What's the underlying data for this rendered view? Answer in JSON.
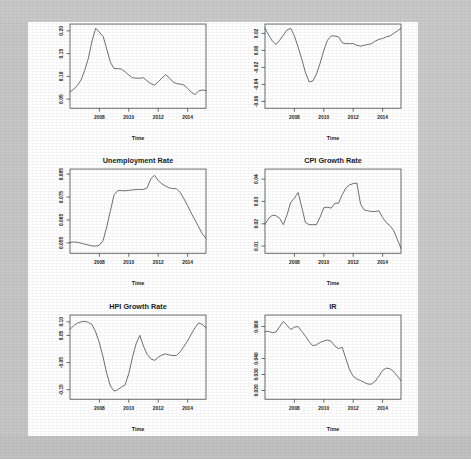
{
  "page": {
    "background_color": "#ffffff",
    "scan_border_color": "#c9c9c9",
    "line_color": "#55575a",
    "axis_color": "#4a4a4a",
    "text_color": "#1c1c1c"
  },
  "figure": {
    "layout": "2 columns x 3 rows",
    "panel_count": 6
  },
  "chart_data": [
    {
      "type": "line",
      "title": "LGD Rate",
      "xlabel": "Time",
      "ylabel": "",
      "xlim": [
        2006.0,
        2015.25
      ],
      "ylim": [
        0.03,
        0.215
      ],
      "xticks": [
        "2008",
        "2010",
        "2012",
        "2014"
      ],
      "xtickvals": [
        2008,
        2010,
        2012,
        2014
      ],
      "yticks": [
        "0.05",
        "0.10",
        "0.15",
        "0.20"
      ],
      "ytickvals": [
        0.05,
        0.1,
        0.15,
        0.2
      ],
      "grid": false,
      "legend": "none",
      "x": [
        2006.0,
        2006.25,
        2006.5,
        2006.75,
        2007.0,
        2007.25,
        2007.5,
        2007.75,
        2008.0,
        2008.25,
        2008.5,
        2008.75,
        2009.0,
        2009.25,
        2009.5,
        2009.75,
        2010.0,
        2010.25,
        2010.5,
        2010.75,
        2011.0,
        2011.25,
        2011.5,
        2011.75,
        2012.0,
        2012.25,
        2012.5,
        2012.75,
        2013.0,
        2013.25,
        2013.5,
        2013.75,
        2014.0,
        2014.25,
        2014.5,
        2014.75,
        2015.0,
        2015.25
      ],
      "values": [
        0.066,
        0.072,
        0.08,
        0.092,
        0.113,
        0.14,
        0.178,
        0.206,
        0.197,
        0.188,
        0.16,
        0.131,
        0.117,
        0.117,
        0.116,
        0.11,
        0.103,
        0.097,
        0.096,
        0.096,
        0.097,
        0.09,
        0.084,
        0.081,
        0.088,
        0.096,
        0.104,
        0.097,
        0.088,
        0.084,
        0.083,
        0.081,
        0.074,
        0.065,
        0.06,
        0.068,
        0.07,
        0.069
      ]
    },
    {
      "type": "line",
      "title": "GDP Growth Rate",
      "xlabel": "Time",
      "ylabel": "",
      "xlim": [
        2006.0,
        2015.25
      ],
      "ylim": [
        -0.068,
        0.031
      ],
      "xticks": [
        "2008",
        "2010",
        "2012",
        "2014"
      ],
      "xtickvals": [
        2008,
        2010,
        2012,
        2014
      ],
      "yticks": [
        "0.02",
        "0.00",
        "-0.02",
        "-0.04",
        "-0.06"
      ],
      "ytickvals": [
        0.02,
        0.0,
        -0.02,
        -0.04,
        -0.06
      ],
      "grid": false,
      "legend": "none",
      "x": [
        2006.0,
        2006.25,
        2006.5,
        2006.75,
        2007.0,
        2007.25,
        2007.5,
        2007.75,
        2008.0,
        2008.25,
        2008.5,
        2008.75,
        2009.0,
        2009.25,
        2009.5,
        2009.75,
        2010.0,
        2010.25,
        2010.5,
        2010.75,
        2011.0,
        2011.25,
        2011.5,
        2011.75,
        2012.0,
        2012.25,
        2012.5,
        2012.75,
        2013.0,
        2013.25,
        2013.5,
        2013.75,
        2014.0,
        2014.25,
        2014.5,
        2014.75,
        2015.0,
        2015.25
      ],
      "values": [
        0.026,
        0.018,
        0.011,
        0.007,
        0.012,
        0.018,
        0.024,
        0.026,
        0.017,
        0.004,
        -0.01,
        -0.026,
        -0.037,
        -0.036,
        -0.028,
        -0.015,
        0.0,
        0.012,
        0.017,
        0.017,
        0.016,
        0.009,
        0.008,
        0.008,
        0.008,
        0.006,
        0.005,
        0.006,
        0.007,
        0.008,
        0.011,
        0.013,
        0.014,
        0.016,
        0.017,
        0.02,
        0.023,
        0.026
      ]
    },
    {
      "type": "line",
      "title": "Unemployment Rate",
      "xlabel": "Time",
      "ylabel": "",
      "xlim": [
        2006.0,
        2015.25
      ],
      "ylim": [
        0.0505,
        0.0872
      ],
      "xticks": [
        "2008",
        "2010",
        "2012",
        "2014"
      ],
      "xtickvals": [
        2008,
        2010,
        2012,
        2014
      ],
      "yticks": [
        "0.055",
        "0.065",
        "0.075",
        "0.085"
      ],
      "ytickvals": [
        0.055,
        0.065,
        0.075,
        0.085
      ],
      "grid": false,
      "legend": "none",
      "x": [
        2006.0,
        2006.25,
        2006.5,
        2006.75,
        2007.0,
        2007.25,
        2007.5,
        2007.75,
        2008.0,
        2008.25,
        2008.5,
        2008.75,
        2009.0,
        2009.25,
        2009.5,
        2009.75,
        2010.0,
        2010.25,
        2010.5,
        2010.75,
        2011.0,
        2011.25,
        2011.5,
        2011.75,
        2012.0,
        2012.25,
        2012.5,
        2012.75,
        2013.0,
        2013.25,
        2013.5,
        2013.75,
        2014.0,
        2014.25,
        2014.5,
        2014.75,
        2015.0,
        2015.25
      ],
      "values": [
        0.0552,
        0.0554,
        0.0553,
        0.0549,
        0.0545,
        0.0541,
        0.0537,
        0.0536,
        0.054,
        0.056,
        0.062,
        0.069,
        0.076,
        0.0778,
        0.0778,
        0.0777,
        0.0779,
        0.0781,
        0.0783,
        0.0783,
        0.0783,
        0.079,
        0.083,
        0.0845,
        0.0822,
        0.0808,
        0.0798,
        0.079,
        0.0787,
        0.0786,
        0.077,
        0.0742,
        0.0712,
        0.068,
        0.065,
        0.062,
        0.059,
        0.057
      ]
    },
    {
      "type": "line",
      "title": "CPI Growth Rate",
      "xlabel": "Time",
      "ylabel": "",
      "xlim": [
        2006.0,
        2015.25
      ],
      "ylim": [
        0.0068,
        0.0445
      ],
      "xticks": [
        "2008",
        "2010",
        "2012",
        "2014"
      ],
      "xtickvals": [
        2008,
        2010,
        2012,
        2014
      ],
      "yticks": [
        "0.01",
        "0.02",
        "0.03",
        "0.04"
      ],
      "ytickvals": [
        0.01,
        0.02,
        0.03,
        0.04
      ],
      "grid": false,
      "legend": "none",
      "x": [
        2006.0,
        2006.25,
        2006.5,
        2006.75,
        2007.0,
        2007.25,
        2007.5,
        2007.75,
        2008.0,
        2008.25,
        2008.5,
        2008.75,
        2009.0,
        2009.25,
        2009.5,
        2009.75,
        2010.0,
        2010.25,
        2010.5,
        2010.75,
        2011.0,
        2011.25,
        2011.5,
        2011.75,
        2012.0,
        2012.25,
        2012.5,
        2012.75,
        2013.0,
        2013.25,
        2013.5,
        2013.75,
        2014.0,
        2014.25,
        2014.5,
        2014.75,
        2015.0,
        2015.25
      ],
      "values": [
        0.0198,
        0.0225,
        0.0238,
        0.0236,
        0.0224,
        0.0196,
        0.024,
        0.0296,
        0.0315,
        0.034,
        0.0275,
        0.0205,
        0.0196,
        0.0196,
        0.0196,
        0.023,
        0.0272,
        0.0274,
        0.027,
        0.0292,
        0.0292,
        0.033,
        0.036,
        0.0374,
        0.038,
        0.0382,
        0.0288,
        0.0262,
        0.0258,
        0.0255,
        0.0255,
        0.0258,
        0.0228,
        0.0205,
        0.0192,
        0.017,
        0.013,
        0.009
      ]
    },
    {
      "type": "line",
      "title": "HPI Growth Rate",
      "xlabel": "Time",
      "ylabel": "",
      "xlim": [
        2006.0,
        2015.25
      ],
      "ylim": [
        -0.185,
        0.125
      ],
      "xticks": [
        "2008",
        "2010",
        "2012",
        "2014"
      ],
      "xtickvals": [
        2008,
        2010,
        2012,
        2014
      ],
      "yticks": [
        "-0.15",
        "-0.05",
        "0.05",
        "0.10"
      ],
      "ytickvals": [
        -0.15,
        -0.05,
        0.05,
        0.1
      ],
      "grid": false,
      "legend": "none",
      "x": [
        2006.0,
        2006.25,
        2006.5,
        2006.75,
        2007.0,
        2007.25,
        2007.5,
        2007.75,
        2008.0,
        2008.25,
        2008.5,
        2008.75,
        2009.0,
        2009.25,
        2009.5,
        2009.75,
        2010.0,
        2010.25,
        2010.5,
        2010.75,
        2011.0,
        2011.25,
        2011.5,
        2011.75,
        2012.0,
        2012.25,
        2012.5,
        2012.75,
        2013.0,
        2013.25,
        2013.5,
        2013.75,
        2014.0,
        2014.25,
        2014.5,
        2014.75,
        2015.0,
        2015.25
      ],
      "values": [
        0.072,
        0.086,
        0.095,
        0.1,
        0.102,
        0.098,
        0.09,
        0.062,
        0.022,
        -0.03,
        -0.09,
        -0.137,
        -0.155,
        -0.15,
        -0.14,
        -0.132,
        -0.09,
        -0.03,
        0.02,
        0.05,
        0.01,
        -0.02,
        -0.036,
        -0.042,
        -0.03,
        -0.022,
        -0.018,
        -0.022,
        -0.024,
        -0.024,
        -0.01,
        0.01,
        0.03,
        0.055,
        0.078,
        0.096,
        0.09,
        0.078
      ]
    },
    {
      "type": "line",
      "title": "IR",
      "xlabel": "Time",
      "ylabel": "",
      "xlim": [
        2006.0,
        2015.25
      ],
      "ylim": [
        0.0145,
        0.0672
      ],
      "xticks": [
        "2008",
        "2010",
        "2012",
        "2014"
      ],
      "xtickvals": [
        2008,
        2010,
        2012,
        2014
      ],
      "yticks": [
        "0.020",
        "0.030",
        "0.040",
        "0.060"
      ],
      "ytickvals": [
        0.02,
        0.03,
        0.04,
        0.06
      ],
      "grid": false,
      "legend": "none",
      "x": [
        2006.0,
        2006.25,
        2006.5,
        2006.75,
        2007.0,
        2007.25,
        2007.5,
        2007.75,
        2008.0,
        2008.25,
        2008.5,
        2008.75,
        2009.0,
        2009.25,
        2009.5,
        2009.75,
        2010.0,
        2010.25,
        2010.5,
        2010.75,
        2011.0,
        2011.25,
        2011.5,
        2011.75,
        2012.0,
        2012.25,
        2012.5,
        2012.75,
        2013.0,
        2013.25,
        2013.5,
        2013.75,
        2014.0,
        2014.25,
        2014.5,
        2014.75,
        2015.0,
        2015.25
      ],
      "values": [
        0.0568,
        0.057,
        0.0562,
        0.0566,
        0.06,
        0.0632,
        0.0608,
        0.0582,
        0.0596,
        0.06,
        0.057,
        0.054,
        0.0505,
        0.048,
        0.0486,
        0.05,
        0.051,
        0.0516,
        0.0508,
        0.0478,
        0.0462,
        0.047,
        0.04,
        0.033,
        0.0288,
        0.0272,
        0.0262,
        0.025,
        0.024,
        0.024,
        0.0258,
        0.029,
        0.0326,
        0.034,
        0.0336,
        0.0318,
        0.029,
        0.0262
      ]
    }
  ]
}
